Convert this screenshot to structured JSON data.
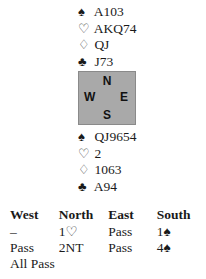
{
  "north": {
    "spades": "A103",
    "hearts": "AKQ74",
    "diamonds": "QJ",
    "clubs": "J73"
  },
  "compass": {
    "n": "N",
    "w": "W",
    "e": "E",
    "s": "S"
  },
  "south": {
    "spades": "QJ9654",
    "hearts": "2",
    "diamonds": "1063",
    "clubs": "A94"
  },
  "suits": {
    "spade": "♠",
    "heart": "♡",
    "diamond": "♢",
    "club": "♣"
  },
  "bidding": {
    "headers": [
      "West",
      "North",
      "East",
      "South"
    ],
    "rows": [
      [
        "–",
        "1♡",
        "Pass",
        "1♠"
      ],
      [
        "Pass",
        "2NT",
        "Pass",
        "4♠"
      ],
      [
        "All Pass",
        "",
        "",
        ""
      ]
    ]
  }
}
